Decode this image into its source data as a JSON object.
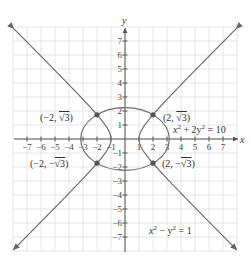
{
  "chart_data": {
    "type": "line",
    "title": "",
    "xlabel": "x",
    "ylabel": "y",
    "xlim": [
      -8,
      8
    ],
    "ylim": [
      -8,
      8
    ],
    "grid": true,
    "x_ticks": [
      "-7",
      "-6",
      "-5",
      "-4",
      "-3",
      "-2",
      "-1",
      "1",
      "2",
      "3",
      "4",
      "5",
      "6",
      "7"
    ],
    "y_ticks": [
      "7",
      "6",
      "5",
      "4",
      "3",
      "2",
      "1",
      "-1",
      "-2",
      "-3",
      "-4",
      "-5",
      "-6",
      "-7"
    ],
    "series": [
      {
        "name": "ellipse",
        "equation": "x² + 2y² = 10",
        "label": "x² + 2y² = 10"
      },
      {
        "name": "hyperbola",
        "equation": "x² − y² = 1",
        "label": "x² − y² = 1"
      }
    ],
    "intersection_points": [
      {
        "x": -2,
        "y": 1.732,
        "label": "(−2, √3)"
      },
      {
        "x": 2,
        "y": 1.732,
        "label": "(2, √3)"
      },
      {
        "x": -2,
        "y": -1.732,
        "label": "(−2, −√3)"
      },
      {
        "x": 2,
        "y": -1.732,
        "label": "(2, −√3)"
      }
    ],
    "colors": {
      "curve": "#6e6e6e",
      "point": "#555555",
      "grid": "#e6e6e6",
      "axis": "#555555"
    }
  },
  "labels": {
    "x_axis": "x",
    "y_axis": "y",
    "ellipse_eq_base": "x",
    "ellipse_eq_mid": " + 2y",
    "ellipse_eq_end": " = 10",
    "hyperbola_eq_base": "x",
    "hyperbola_eq_mid": " − y",
    "hyperbola_eq_end": " = 1",
    "sup2": "2",
    "p_tl_a": "(−2, ",
    "p_tl_b": "√3",
    "p_tl_c": ")",
    "p_tr_a": "(2, ",
    "p_tr_b": "√3",
    "p_tr_c": ")",
    "p_bl_a": "(−2, −",
    "p_bl_b": "√3",
    "p_bl_c": ")",
    "p_br_a": "(2, −",
    "p_br_b": "√3",
    "p_br_c": ")"
  }
}
